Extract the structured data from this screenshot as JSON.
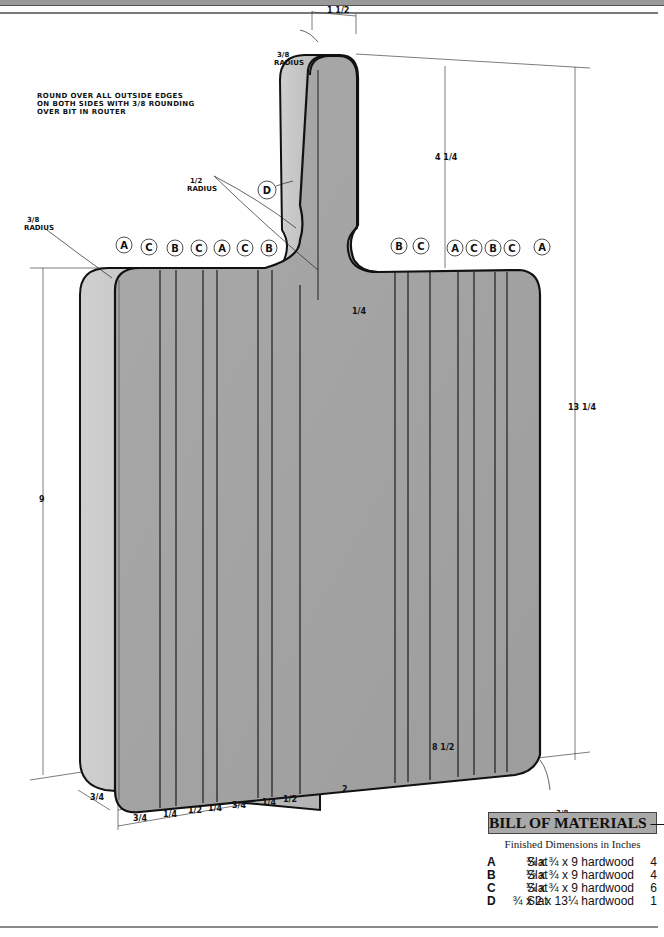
{
  "drawing": {
    "title": "Cutting Board",
    "note": "ROUND OVER ALL OUTSIDE EDGES\nON BOTH SIDES WITH 3/8 ROUNDING\nOVER BIT IN ROUTER",
    "radius_labels": {
      "handle_top": [
        "3/8",
        "RADIUS"
      ],
      "handle_neck": [
        "1/2",
        "RADIUS"
      ],
      "board_top_left": [
        "3/8",
        "RADIUS"
      ],
      "board_bottom_right": [
        "3/8",
        "RADIUS"
      ]
    },
    "dimensions": {
      "handle_width": "1 1/2",
      "handle_length": "4 1/4",
      "overall_length": "13 1/4",
      "board_height": "9",
      "neck_offset": "1/4",
      "thickness": "3/4",
      "bottom_segments": [
        "3/4",
        "1/4",
        "1/2",
        "1/4",
        "3/4",
        "1/4",
        "1/2",
        "2"
      ],
      "overall_width": "8 1/2"
    },
    "part_callouts_left": [
      "A",
      "C",
      "B",
      "C",
      "A",
      "C",
      "B"
    ],
    "part_callouts_right": [
      "B",
      "C",
      "A",
      "C",
      "B",
      "C",
      "A"
    ],
    "handle_callout": "D",
    "colors": {
      "face": "#a3a3a3",
      "edge": "#c8c8c8",
      "outline": "#111111"
    }
  },
  "bill_of_materials": {
    "title": "BILL OF MATERIALS — Cutting Board",
    "subtitle": "Finished Dimensions in Inches",
    "rows": [
      {
        "part": "A",
        "name": "Slat",
        "dimensions": "¾ x ¾ x 9 hardwood",
        "qty": "4"
      },
      {
        "part": "B",
        "name": "Slat",
        "dimensions": "½ x ¾ x 9 hardwood",
        "qty": "4"
      },
      {
        "part": "C",
        "name": "Slat",
        "dimensions": "¼ x ¾ x 9 hardwood",
        "qty": "6"
      },
      {
        "part": "D",
        "name": "Slat",
        "dimensions": "¾ x 2 x 13¼ hardwood",
        "qty": "1"
      }
    ]
  }
}
